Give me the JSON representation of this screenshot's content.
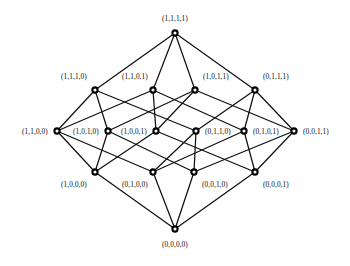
{
  "figure": {
    "width": 350,
    "height": 266,
    "background_color": "#ffffff",
    "node_fill_color": "#ffffff",
    "node_stroke_color": "#000000",
    "edge_color": "#111111"
  },
  "chart_data": {
    "type": "diagram",
    "diagram_kind": "hasse-diagram",
    "title": "",
    "xlabel": "",
    "ylabel": "",
    "ranks": [
      {
        "rank": 4,
        "y": 33,
        "labels": [
          "(1,1,1,1)"
        ]
      },
      {
        "rank": 3,
        "y": 90,
        "labels": [
          "(1,1,1,0)",
          "(1,1,0,1)",
          "(1,0,1,1)",
          "(0,1,1,1)"
        ]
      },
      {
        "rank": 2,
        "y": 131,
        "labels": [
          "(1,1,0,0)",
          "(1,0,1,0)",
          "(1,0,0,1)",
          "(0,1,1,0)",
          "(0,1,0,1)",
          "(0,0,1,1)"
        ]
      },
      {
        "rank": 1,
        "y": 172,
        "labels": [
          "(1,0,0,0)",
          "(0,1,0,0)",
          "(0,0,1,0)",
          "(0,0,0,1)"
        ]
      },
      {
        "rank": 0,
        "y": 229,
        "labels": [
          "(0,0,0,0)"
        ]
      }
    ],
    "nodes": [
      {
        "id": "1111",
        "label": "(1,1,1,1)",
        "x": 175,
        "y": 33,
        "rank": 4,
        "label_dx": 0,
        "label_dy": -15,
        "label_align": "center"
      },
      {
        "id": "1110",
        "label": "(1,1,1,0)",
        "x": 95,
        "y": 90,
        "rank": 3,
        "label_dx": -8,
        "label_dy": -14,
        "label_align": "right"
      },
      {
        "id": "1101",
        "label": "(1,1,0,1)",
        "x": 153,
        "y": 90,
        "rank": 3,
        "label_dx": -5,
        "label_dy": -14,
        "label_align": "right"
      },
      {
        "id": "1011",
        "label": "(1,0,1,1)",
        "x": 195,
        "y": 90,
        "rank": 3,
        "label_dx": 8,
        "label_dy": -14,
        "label_align": "left"
      },
      {
        "id": "0111",
        "label": "(0,1,1,1)",
        "x": 255,
        "y": 90,
        "rank": 3,
        "label_dx": 8,
        "label_dy": -14,
        "label_align": "left"
      },
      {
        "id": "1100",
        "label": "(1,1,0,0)",
        "x": 57,
        "y": 131,
        "rank": 2,
        "label_dx": -9,
        "label_dy": 0,
        "label_align": "right"
      },
      {
        "id": "1010",
        "label": "(1,0,1,0)",
        "x": 108,
        "y": 131,
        "rank": 2,
        "label_dx": -9,
        "label_dy": 0,
        "label_align": "right"
      },
      {
        "id": "1001",
        "label": "(1,0,0,1)",
        "x": 156,
        "y": 131,
        "rank": 2,
        "label_dx": -9,
        "label_dy": 0,
        "label_align": "right"
      },
      {
        "id": "0110",
        "label": "(0,1,1,0)",
        "x": 196,
        "y": 131,
        "rank": 2,
        "label_dx": 9,
        "label_dy": 0,
        "label_align": "left"
      },
      {
        "id": "0101",
        "label": "(0,1,0,1)",
        "x": 244,
        "y": 131,
        "rank": 2,
        "label_dx": 9,
        "label_dy": 0,
        "label_align": "left"
      },
      {
        "id": "0011",
        "label": "(0,0,1,1)",
        "x": 294,
        "y": 131,
        "rank": 2,
        "label_dx": 9,
        "label_dy": 0,
        "label_align": "left"
      },
      {
        "id": "1000",
        "label": "(1,0,0,0)",
        "x": 95,
        "y": 172,
        "rank": 1,
        "label_dx": -8,
        "label_dy": 12,
        "label_align": "right"
      },
      {
        "id": "0100",
        "label": "(0,1,0,0)",
        "x": 153,
        "y": 172,
        "rank": 1,
        "label_dx": -5,
        "label_dy": 12,
        "label_align": "right"
      },
      {
        "id": "0010",
        "label": "(0,0,1,0)",
        "x": 194,
        "y": 172,
        "rank": 1,
        "label_dx": 8,
        "label_dy": 12,
        "label_align": "left"
      },
      {
        "id": "0001",
        "label": "(0,0,0,1)",
        "x": 255,
        "y": 172,
        "rank": 1,
        "label_dx": 8,
        "label_dy": 12,
        "label_align": "left"
      },
      {
        "id": "0000",
        "label": "(0,0,0,0)",
        "x": 175,
        "y": 229,
        "rank": 0,
        "label_dx": 0,
        "label_dy": 15,
        "label_align": "center"
      }
    ],
    "edges": [
      [
        "1111",
        "1110"
      ],
      [
        "1111",
        "1101"
      ],
      [
        "1111",
        "1011"
      ],
      [
        "1111",
        "0111"
      ],
      [
        "1110",
        "1100"
      ],
      [
        "1110",
        "1010"
      ],
      [
        "1110",
        "0110"
      ],
      [
        "1101",
        "1100"
      ],
      [
        "1101",
        "1001"
      ],
      [
        "1101",
        "0101"
      ],
      [
        "1011",
        "1010"
      ],
      [
        "1011",
        "1001"
      ],
      [
        "1011",
        "0011"
      ],
      [
        "0111",
        "0110"
      ],
      [
        "0111",
        "0101"
      ],
      [
        "0111",
        "0011"
      ],
      [
        "1100",
        "1000"
      ],
      [
        "1100",
        "0100"
      ],
      [
        "1010",
        "1000"
      ],
      [
        "1010",
        "0010"
      ],
      [
        "1001",
        "1000"
      ],
      [
        "1001",
        "0001"
      ],
      [
        "0110",
        "0100"
      ],
      [
        "0110",
        "0010"
      ],
      [
        "0101",
        "0100"
      ],
      [
        "0101",
        "0001"
      ],
      [
        "0011",
        "0010"
      ],
      [
        "0011",
        "0001"
      ],
      [
        "1000",
        "0000"
      ],
      [
        "0100",
        "0000"
      ],
      [
        "0010",
        "0000"
      ],
      [
        "0001",
        "0000"
      ]
    ],
    "node_count": 16,
    "edge_count": 32
  }
}
